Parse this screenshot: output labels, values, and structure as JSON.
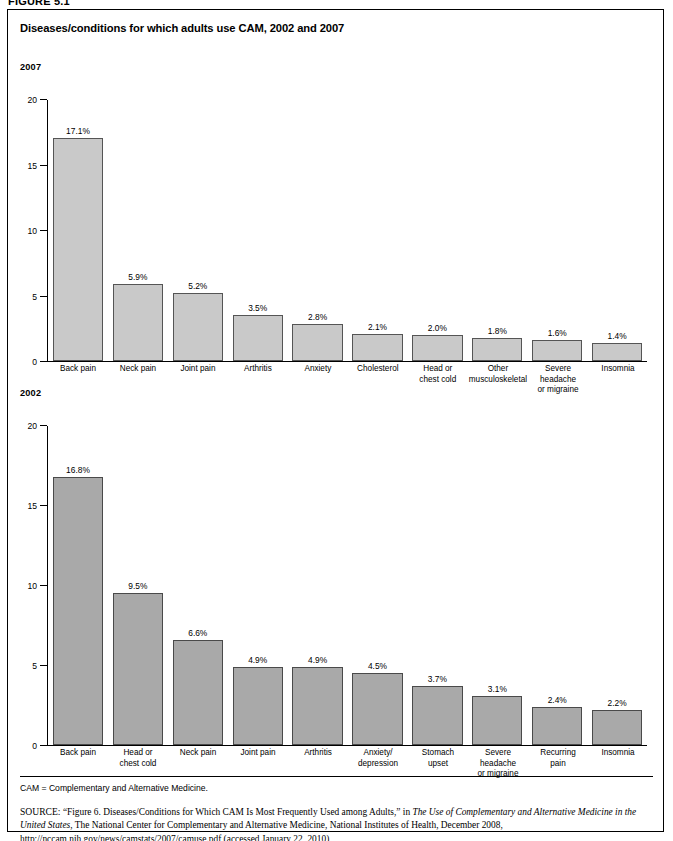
{
  "figure_label": "FIGURE 5.1",
  "title": "Diseases/conditions for which adults use CAM, 2002 and 2007",
  "panels": {
    "y2007": {
      "year_label": "2007"
    },
    "y2002": {
      "year_label": "2002"
    }
  },
  "footnotes": {
    "abbreviation": "CAM = Complementary and Alternative Medicine.",
    "source_word": "SOURCE:",
    "source_part1": " “Figure 6. Diseases/Conditions for Which CAM Is Most Frequently Used among Adults,” in ",
    "source_italic1": "The Use of Complementary and Alternative Medicine in the United States",
    "source_part2": ", The National Center for Complementary and Alternative Medicine, National Institutes of Health, December 2008, http://nccam.nih.gov/news/camstats/2007/camuse.pdf (accessed January 22, 2010)"
  },
  "chart_data": [
    {
      "type": "bar",
      "title": "2007",
      "xlabel": "",
      "ylabel": "",
      "ylim": [
        0,
        20
      ],
      "yticks": [
        0,
        5,
        10,
        15,
        20
      ],
      "ytick_labels": [
        "0",
        "5",
        "10",
        "15",
        "20"
      ],
      "grid": false,
      "legend": "none",
      "bar_color": "#c9c9c9",
      "categories": [
        "Back pain",
        "Neck pain",
        "Joint pain",
        "Arthritis",
        "Anxiety",
        "Cholesterol",
        "Head or\nchest cold",
        "Other\nmusculoskeletal",
        "Severe headache\nor migraine",
        "Insomnia"
      ],
      "values": [
        17.1,
        5.9,
        5.2,
        3.5,
        2.8,
        2.1,
        2.0,
        1.8,
        1.6,
        1.4
      ],
      "data_labels": [
        "17.1%",
        "5.9%",
        "5.2%",
        "3.5%",
        "2.8%",
        "2.1%",
        "2.0%",
        "1.8%",
        "1.6%",
        "1.4%"
      ]
    },
    {
      "type": "bar",
      "title": "2002",
      "xlabel": "",
      "ylabel": "",
      "ylim": [
        0,
        20
      ],
      "yticks": [
        0,
        5,
        10,
        15,
        20
      ],
      "ytick_labels": [
        "0",
        "5",
        "10",
        "15",
        "20"
      ],
      "grid": false,
      "legend": "none",
      "bar_color": "#a9a9a9",
      "categories": [
        "Back pain",
        "Head or\nchest cold",
        "Neck pain",
        "Joint pain",
        "Arthritis",
        "Anxiety/\ndepression",
        "Stomach\nupset",
        "Severe\nheadache\nor migraine",
        "Recurring\npain",
        "Insomnia"
      ],
      "values": [
        16.8,
        9.5,
        6.6,
        4.9,
        4.9,
        4.5,
        3.7,
        3.1,
        2.4,
        2.2
      ],
      "data_labels": [
        "16.8%",
        "9.5%",
        "6.6%",
        "4.9%",
        "4.9%",
        "4.5%",
        "3.7%",
        "3.1%",
        "2.4%",
        "2.2%"
      ]
    }
  ]
}
